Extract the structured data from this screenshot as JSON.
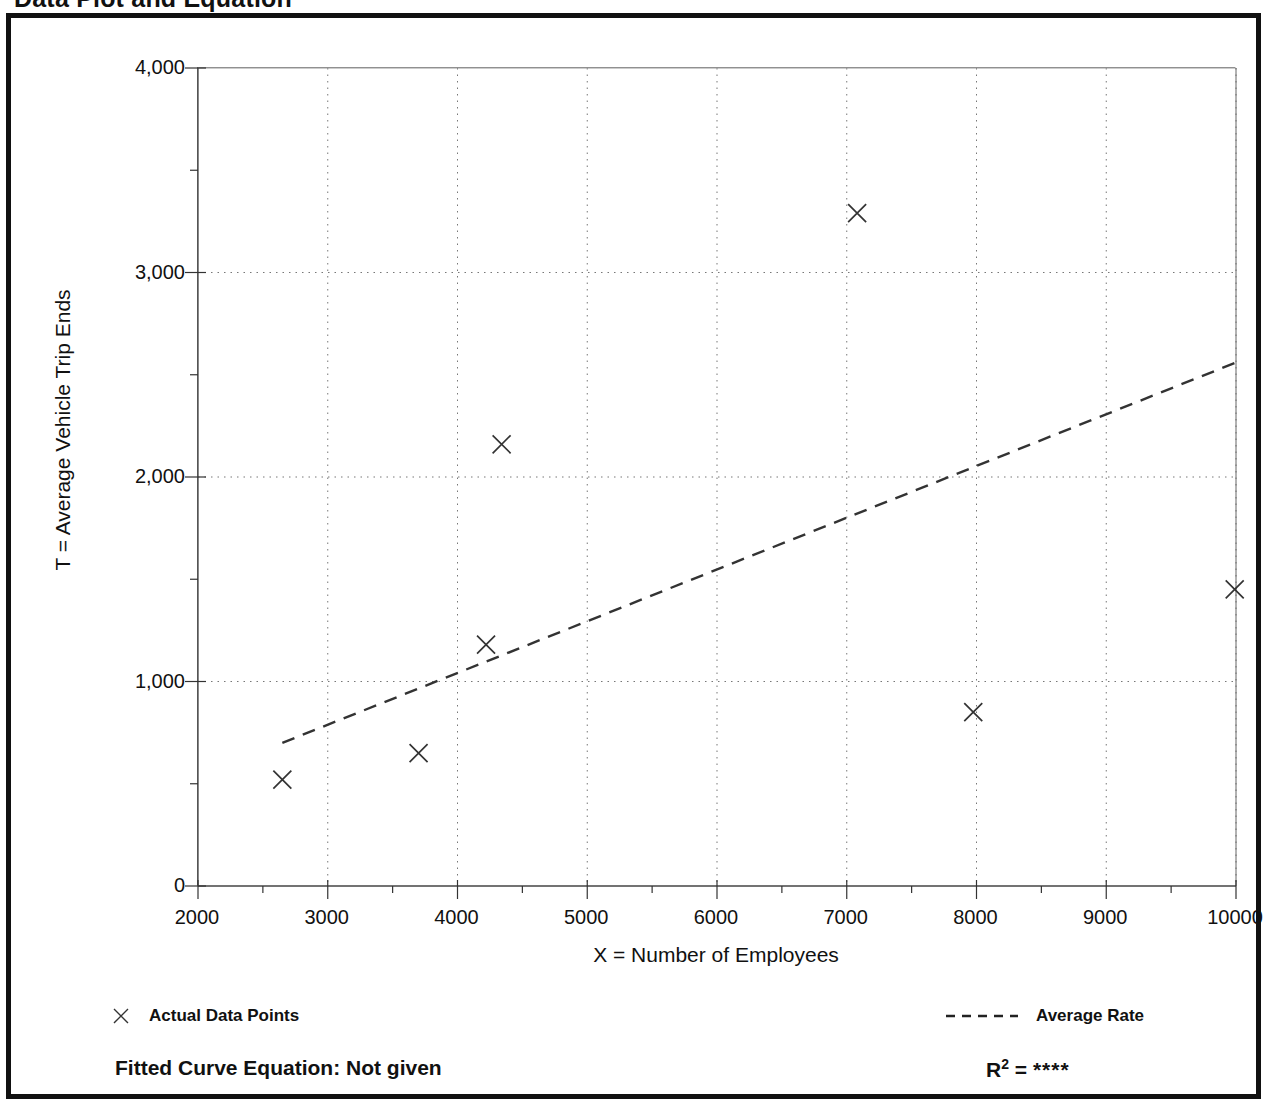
{
  "page": {
    "heading": "Data Plot and Equation"
  },
  "chart_data": {
    "type": "scatter",
    "title": "Data Plot and Equation",
    "xlabel": "X = Number of Employees",
    "ylabel": "T = Average Vehicle Trip Ends",
    "xlim": [
      2000,
      10000
    ],
    "ylim": [
      0,
      4000
    ],
    "grid": true,
    "x_ticks": [
      2000,
      3000,
      4000,
      5000,
      6000,
      7000,
      8000,
      9000,
      10000
    ],
    "x_tick_labels": [
      "2000",
      "3000",
      "4000",
      "5000",
      "6000",
      "7000",
      "8000",
      "9000",
      "10000"
    ],
    "x_minor_tick_step": 500,
    "y_ticks": [
      0,
      1000,
      2000,
      3000,
      4000
    ],
    "y_tick_labels": [
      "0",
      "1,000",
      "2,000",
      "3,000",
      "4,000"
    ],
    "y_minor_tick_step": 500,
    "legend_position": "below-plot",
    "series": [
      {
        "name": "Actual Data Points",
        "type": "scatter",
        "marker": "x",
        "color": "#333333",
        "points": [
          {
            "x": 2650,
            "y": 520
          },
          {
            "x": 3700,
            "y": 650
          },
          {
            "x": 4220,
            "y": 1180
          },
          {
            "x": 4340,
            "y": 2160
          },
          {
            "x": 7080,
            "y": 3290
          },
          {
            "x": 7975,
            "y": 850
          },
          {
            "x": 9990,
            "y": 1450
          }
        ]
      },
      {
        "name": "Average Rate",
        "type": "line",
        "style": "dashed",
        "color": "#333333",
        "points": [
          {
            "x": 2650,
            "y": 700
          },
          {
            "x": 10000,
            "y": 2560
          }
        ]
      }
    ],
    "annotations": {
      "fitted_curve_equation": "Fitted Curve Equation:  Not given",
      "r_squared": "****"
    }
  },
  "legend": {
    "actual_label": "Actual Data Points",
    "average_label": "Average Rate"
  },
  "footer": {
    "equation": "Fitted Curve Equation:  Not given",
    "r2_prefix": "R",
    "r2_superscript": "2",
    "r2_equals": " = ",
    "r2_value": "****"
  }
}
